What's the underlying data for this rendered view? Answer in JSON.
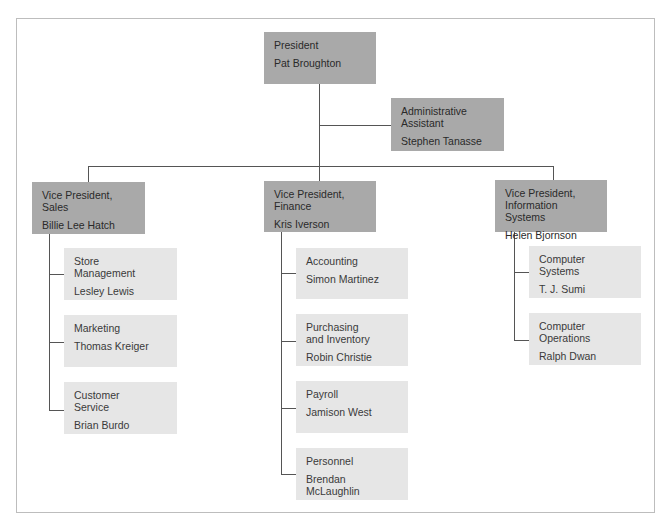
{
  "president": {
    "title": "President",
    "name": "Pat Broughton"
  },
  "assistant": {
    "title": "Administrative\nAssistant",
    "name": "Stephen Tanasse"
  },
  "vps": [
    {
      "title": "Vice President,\nSales",
      "name": "Billie Lee Hatch",
      "units": [
        {
          "title": "Store\nManagement",
          "name": "Lesley Lewis"
        },
        {
          "title": "Marketing",
          "name": "Thomas Kreiger"
        },
        {
          "title": "Customer\nService",
          "name": "Brian Burdo"
        }
      ]
    },
    {
      "title": "Vice President,\nFinance",
      "name": "Kris Iverson",
      "units": [
        {
          "title": "Accounting",
          "name": "Simon Martinez"
        },
        {
          "title": "Purchasing\nand Inventory",
          "name": "Robin Christie"
        },
        {
          "title": "Payroll",
          "name": "Jamison West"
        },
        {
          "title": "Personnel",
          "name": "Brendan\nMcLaughlin"
        }
      ]
    },
    {
      "title": "Vice President,\nInformation Systems",
      "name": "Helen Bjornson",
      "units": [
        {
          "title": "Computer\nSystems",
          "name": "T. J. Sumi"
        },
        {
          "title": "Computer\nOperations",
          "name": "Ralph Dwan"
        }
      ]
    }
  ],
  "colors": {
    "executive_box": "#a9a9a9",
    "unit_box": "#e6e6e6",
    "line": "#555555"
  }
}
